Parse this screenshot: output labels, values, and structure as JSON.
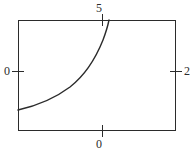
{
  "figure": {
    "background_color": "#ffffff",
    "line_color": "#2b2b2b",
    "frame": {
      "x": 18,
      "y": 20,
      "width": 158,
      "height": 111,
      "stroke_width": 1
    },
    "ticks": [
      {
        "name": "top-tick",
        "x1": 102,
        "y1": 14,
        "x2": 102,
        "y2": 26
      },
      {
        "name": "bottom-tick",
        "x1": 102,
        "y1": 125,
        "x2": 102,
        "y2": 137
      },
      {
        "name": "left-tick",
        "x1": 12,
        "y1": 71,
        "x2": 24,
        "y2": 71
      },
      {
        "name": "right-tick",
        "x1": 170,
        "y1": 71,
        "x2": 182,
        "y2": 71
      }
    ],
    "curve": {
      "name": "exponential-curve",
      "stroke_width": 1.4,
      "path": "M 18 110 C 36 106, 54 99, 70 87 C 84 76, 95 60, 103 40 C 106 32, 108 25, 109 20"
    }
  },
  "chart_data": {
    "type": "line",
    "title": "",
    "xlabel": "",
    "ylabel": "",
    "grid": false,
    "legend": null,
    "xlim": [
      0,
      2
    ],
    "ylim": [
      0,
      5
    ],
    "x_tick_labels": {
      "top": "5",
      "bottom": "0"
    },
    "y_tick_labels": {
      "left": "0",
      "right": "2"
    },
    "axis_tick_labels": {
      "top": "5",
      "bottom": "0",
      "left": "0",
      "right": "2"
    },
    "series": [
      {
        "name": "curve",
        "x": [
          0.0,
          0.25,
          0.5,
          0.75,
          1.0,
          1.1,
          1.2,
          1.3,
          1.4,
          1.5
        ],
        "y": [
          0.95,
          1.15,
          1.45,
          1.85,
          2.45,
          2.75,
          3.15,
          3.6,
          4.2,
          5.0
        ]
      }
    ]
  }
}
